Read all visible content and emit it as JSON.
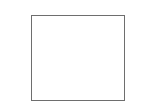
{
  "canvas": {
    "width": 156,
    "height": 109,
    "background_color": "#ffffff"
  },
  "diagram": {
    "type": "shape-outline",
    "shapes": [
      {
        "name": "square-outline",
        "kind": "rectangle",
        "label": "",
        "x": 31,
        "y": 15,
        "width": 94,
        "height": 86,
        "fill_color": "#ffffff",
        "border_color": "#6e6e6e",
        "border_width": 1
      }
    ]
  }
}
